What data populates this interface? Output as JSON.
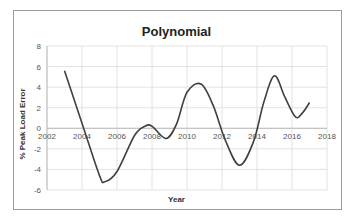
{
  "chart_data": {
    "type": "line",
    "title": "Polynomial",
    "xlabel": "Year",
    "ylabel": "% Peak Load Error",
    "xlim": [
      2002,
      2018
    ],
    "ylim": [
      -6,
      8
    ],
    "x_ticks": [
      "2002",
      "2004",
      "2006",
      "2008",
      "2010",
      "2012",
      "2014",
      "2016",
      "2018"
    ],
    "y_ticks": [
      "8",
      "6",
      "4",
      "2",
      "0",
      "-2",
      "-4",
      "-6"
    ],
    "grid": true,
    "legend": "none",
    "series": [
      {
        "name": "Polynomial",
        "color": "#404040",
        "x": [
          2003,
          2004,
          2005,
          2005.3,
          2006,
          2007,
          2007.6,
          2008,
          2008.8,
          2009.4,
          2010,
          2010.8,
          2011.5,
          2012.2,
          2013,
          2013.8,
          2014.4,
          2015,
          2015.6,
          2016.2,
          2016.6,
          2017
        ],
        "y": [
          5.6,
          0.5,
          -4.6,
          -5.2,
          -4.2,
          -0.7,
          0.2,
          0.2,
          -1.0,
          0.4,
          3.5,
          4.3,
          2.2,
          -1.2,
          -3.6,
          -1.3,
          2.6,
          5.1,
          3.0,
          1.1,
          1.5,
          2.5
        ]
      }
    ]
  }
}
